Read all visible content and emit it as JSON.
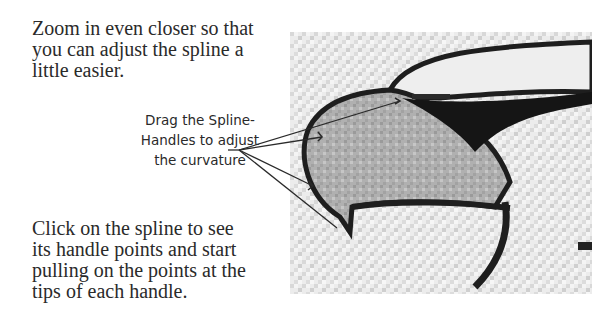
{
  "instructions": {
    "top_paragraph": "Zoom in even closer so that\nyou can adjust the spline a\nlittle easier.",
    "bottom_paragraph": "Click on the spline to see\nits handle points and start\npulling on the points at the\ntips of each handle."
  },
  "callout": {
    "label": "Drag the Spline-\nHandles to adjust\nthe curvature",
    "arrow_count": 4
  },
  "figure": {
    "colors": {
      "background_noise": "#e6e6e6",
      "beak_fill": "#b4b4b4",
      "outline": "#1e1e1e"
    }
  }
}
